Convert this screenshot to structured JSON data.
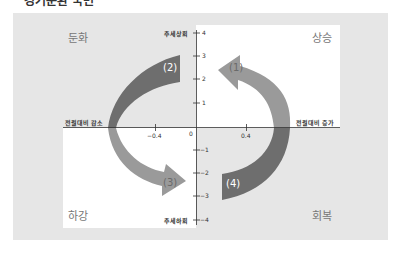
{
  "title": "경기순환 국면",
  "quadrants": {
    "top_left": "둔화",
    "top_right": "상승",
    "bottom_left": "하강",
    "bottom_right": "회복"
  },
  "axes": {
    "y_top_label": "추세상회",
    "y_bottom_label": "추세하회",
    "x_left_label": "전월대비 감소",
    "x_right_label": "전월대비 증가",
    "y_ticks": [
      "4",
      "3",
      "2",
      "1",
      "0",
      "−1",
      "−2",
      "−3",
      "−4"
    ],
    "x_ticks": [
      "−0.4",
      "0.4"
    ],
    "origin_label": "0"
  },
  "arrows": [
    {
      "id": "1",
      "label": "(1)",
      "from": "상승",
      "to": "둔화",
      "color": "#9a9a9a"
    },
    {
      "id": "2",
      "label": "(2)",
      "from": "둔화",
      "to": "하강",
      "color": "#6e6e6e"
    },
    {
      "id": "3",
      "label": "(3)",
      "from": "하강",
      "to": "회복",
      "color": "#9a9a9a"
    },
    {
      "id": "4",
      "label": "(4)",
      "from": "회복",
      "to": "상승",
      "color": "#6e6e6e"
    }
  ],
  "colors": {
    "panel_bg": "#e6e6e6",
    "white_quadrant": "#ffffff",
    "arrow_light": "#9a9a9a",
    "arrow_dark": "#6e6e6e",
    "axis": "#333333"
  }
}
